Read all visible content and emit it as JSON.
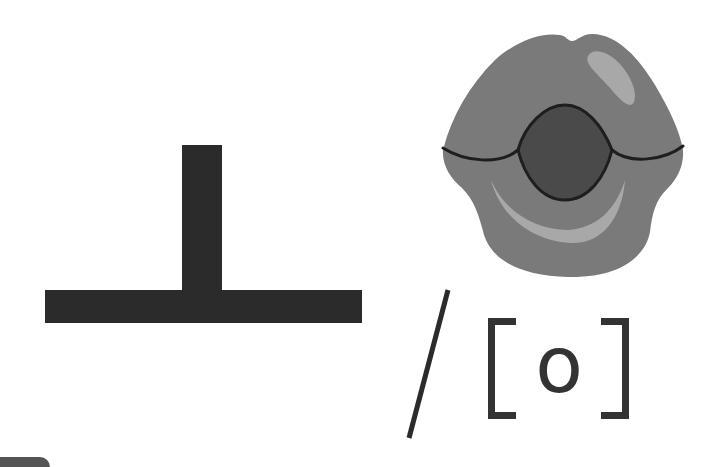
{
  "illustration": {
    "hangul_letter": {
      "char": "ㅗ",
      "description": "Korean vowel letter drawn as a T-shaped block (vertical stroke over horizontal base)"
    },
    "separator": "/",
    "ipa": {
      "open_bracket": "[",
      "symbol": "o",
      "close_bracket": "]"
    },
    "mouth_icon": {
      "label": "mouth-shape-rounded-o",
      "description": "Rounded lips showing the mouth position for the vowel"
    }
  },
  "colors": {
    "background": "#ffffff",
    "ink": "#2b2b2b",
    "text": "#333333",
    "lip": "#7a7a7a",
    "lip_outline": "#1e1e1e",
    "mouth_opening": "#4a4a4a",
    "lip_highlight": "#a8a8a8",
    "bottom_tab": "#555555"
  }
}
